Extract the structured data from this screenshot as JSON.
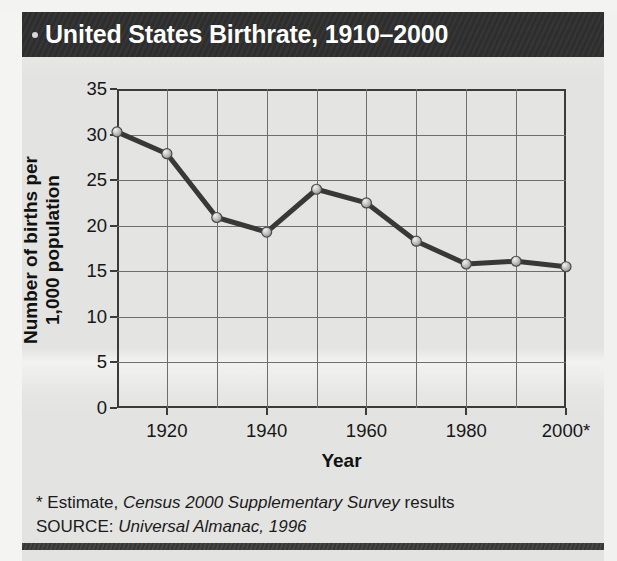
{
  "figure": {
    "title": "United States Birthrate, 1910–2000",
    "title_bullet_icon": "bullet-dot-icon",
    "footnote_estimate_prefix": "* Estimate, ",
    "footnote_estimate_italic": "Census 2000 Supplementary Survey",
    "footnote_estimate_suffix": " results",
    "source_prefix": "SOURCE: ",
    "source_italic": "Universal Almanac, 1996",
    "colors": {
      "title_bar_bg": "#2f2f2f",
      "title_text": "#ffffff",
      "paper_bg": "#e3e3e1",
      "axis": "#3b3b3b",
      "grid": "#6e6e6e",
      "series_line": "#383838",
      "marker_fill": "#b6b6b6",
      "marker_stroke": "#4a4a4a",
      "bottom_rule": "#3a3a3a"
    }
  },
  "chart_data": {
    "type": "line",
    "title": "United States Birthrate, 1910–2000",
    "xlabel": "Year",
    "ylabel": "Number of births per 1,000 population",
    "ylabel_line1": "Number of births per",
    "ylabel_line2": "1,000 population",
    "x": [
      1910,
      1920,
      1930,
      1940,
      1950,
      1960,
      1970,
      1980,
      1990,
      2000
    ],
    "values": [
      30.3,
      27.9,
      20.9,
      19.3,
      24.0,
      22.5,
      18.3,
      15.8,
      16.1,
      15.5
    ],
    "xlim": [
      1910,
      2000
    ],
    "ylim": [
      0,
      35
    ],
    "yticks": [
      0,
      5,
      10,
      15,
      20,
      25,
      30,
      35
    ],
    "ytick_labels": [
      "0",
      "5",
      "10",
      "15",
      "20",
      "25",
      "30",
      "35"
    ],
    "xticks": [
      1920,
      1940,
      1960,
      1980,
      2000
    ],
    "xtick_labels": [
      "1920",
      "1940",
      "1960",
      "1980",
      "2000*"
    ],
    "grid": true,
    "legend": null,
    "marker": "circle",
    "annotations": [
      "* Estimate, Census 2000 Supplementary Survey results",
      "SOURCE: Universal Almanac, 1996"
    ]
  }
}
